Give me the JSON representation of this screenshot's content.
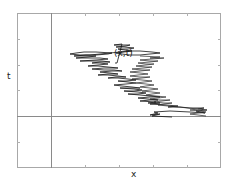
{
  "diagram": {
    "type": "random-walk-path",
    "axis_labels": {
      "x": "x",
      "t": "t"
    },
    "annotation": "(x,t)",
    "colors": {
      "frame": "#9a9a9a",
      "axis": "#8a8a8a",
      "path": "#111111",
      "background": "#ffffff"
    }
  }
}
